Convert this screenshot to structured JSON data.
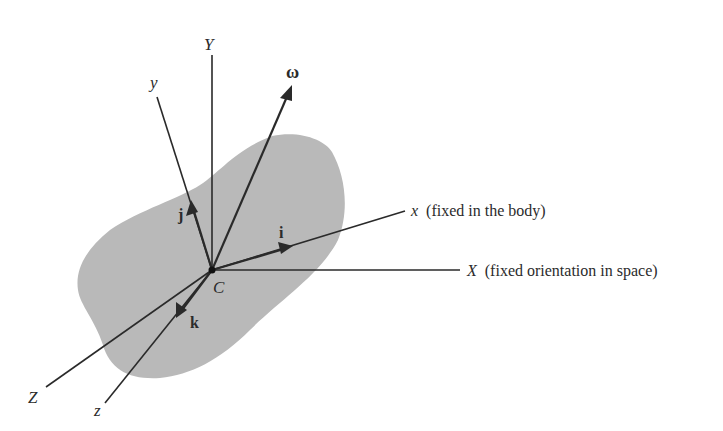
{
  "figure": {
    "colors": {
      "body_fill": "#b9b9b9",
      "line": "#2a2a2a",
      "text": "#2b2b2b",
      "background": "#ffffff"
    },
    "point": {
      "label": "C"
    },
    "space_axes": {
      "X": {
        "label": "X",
        "note": "(fixed orientation in space)"
      },
      "Y": {
        "label": "Y"
      },
      "Z": {
        "label": "Z"
      }
    },
    "body_axes": {
      "x": {
        "label": "x",
        "note": "(fixed in the body)"
      },
      "y": {
        "label": "y"
      },
      "z": {
        "label": "z"
      }
    },
    "unit_vectors": {
      "i": {
        "label": "i"
      },
      "j": {
        "label": "j"
      },
      "k": {
        "label": "k"
      }
    },
    "angular_velocity": {
      "label": "ω"
    }
  }
}
